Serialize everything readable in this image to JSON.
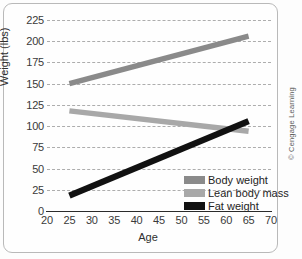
{
  "chart_data": {
    "type": "line",
    "title": "",
    "xlabel": "Age",
    "ylabel": "Weight (lbs)",
    "xlim": [
      20,
      70
    ],
    "ylim": [
      0,
      225
    ],
    "xticks": [
      20,
      25,
      30,
      35,
      40,
      45,
      50,
      55,
      60,
      65,
      70
    ],
    "yticks": [
      0,
      25,
      50,
      75,
      100,
      125,
      150,
      175,
      200,
      225
    ],
    "grid": "horizontal-dashed",
    "legend_position": "lower-right",
    "series": [
      {
        "name": "Body weight",
        "color": "#8a8a8a",
        "x": [
          25,
          65
        ],
        "values": [
          150,
          206
        ]
      },
      {
        "name": "Lean body mass",
        "color": "#a8a8a8",
        "x": [
          25,
          65
        ],
        "values": [
          118,
          94
        ]
      },
      {
        "name": "Fat weight",
        "color": "#111111",
        "x": [
          25,
          65
        ],
        "values": [
          18,
          106
        ]
      }
    ]
  },
  "axes": {
    "y_tick_labels": [
      "225",
      "200",
      "175",
      "150",
      "125",
      "100",
      "75",
      "50",
      "25",
      "0"
    ],
    "x_tick_labels": [
      "20",
      "25",
      "30",
      "35",
      "40",
      "45",
      "50",
      "55",
      "60",
      "65",
      "70"
    ],
    "y_axis_title": "Weight (lbs)",
    "x_axis_title": "Age"
  },
  "legend": {
    "items": [
      {
        "label": "Body weight",
        "color": "#8a8a8a"
      },
      {
        "label": "Lean body mass",
        "color": "#a8a8a8"
      },
      {
        "label": "Fat weight",
        "color": "#111111"
      }
    ]
  },
  "credit": "© Cengage Learning"
}
